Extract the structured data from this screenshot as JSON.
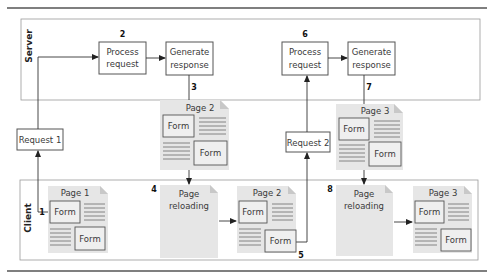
{
  "zones": {
    "server": {
      "label": "Server"
    },
    "client": {
      "label": "Client"
    }
  },
  "server_steps": [
    {
      "id": "process-request-1",
      "step": "2",
      "lines": [
        "Process",
        "request"
      ]
    },
    {
      "id": "generate-response-1",
      "step": "",
      "lines": [
        "Generate",
        "response"
      ]
    },
    {
      "id": "process-request-2",
      "step": "6",
      "lines": [
        "Process",
        "request"
      ]
    },
    {
      "id": "generate-response-2",
      "step": "",
      "lines": [
        "Generate",
        "response"
      ]
    }
  ],
  "requests": [
    {
      "id": "request-1",
      "label": "Request 1"
    },
    {
      "id": "request-2",
      "label": "Request 2"
    }
  ],
  "step_numbers": {
    "s1": "1",
    "s2": "2",
    "s3": "3",
    "s4": "4",
    "s5": "5",
    "s6": "6",
    "s7": "7",
    "s8": "8"
  },
  "documents": {
    "server_page2": {
      "title": "Page 2",
      "form1": "Form",
      "form2": "Form"
    },
    "server_page3": {
      "title": "Page 3",
      "form1": "Form",
      "form2": "Form"
    },
    "client_page1": {
      "title": "Page 1",
      "form1": "Form",
      "form2": "Form"
    },
    "client_reload1": {
      "lines": [
        "Page",
        "reloading"
      ]
    },
    "client_page2": {
      "title": "Page 2",
      "form1": "Form",
      "form2": "Form"
    },
    "client_reload2": {
      "lines": [
        "Page",
        "reloading"
      ]
    },
    "client_page3": {
      "title": "Page 3",
      "form1": "Form",
      "form2": "Form"
    }
  },
  "colors": {
    "doc_fill": "#e6e6e6",
    "border": "#555555",
    "zone_border": "#9a9a9a"
  }
}
